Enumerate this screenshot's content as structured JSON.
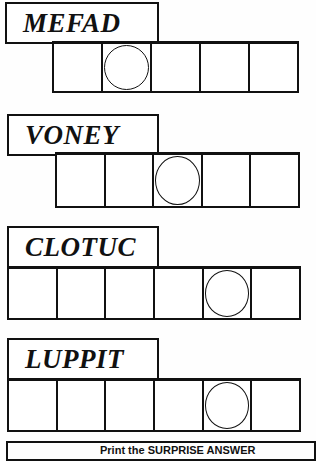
{
  "puzzles": [
    {
      "scrambled": "MEFAD",
      "cells": 5,
      "circled_index": 1
    },
    {
      "scrambled": "VONEY",
      "cells": 5,
      "circled_index": 2
    },
    {
      "scrambled": "CLOTUC",
      "cells": 6,
      "circled_index": 4
    },
    {
      "scrambled": "LUPPIT",
      "cells": 6,
      "circled_index": 4
    }
  ],
  "answer_prompt": "Print the SURPRISE ANSWER"
}
